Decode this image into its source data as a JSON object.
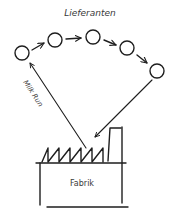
{
  "diagram": {
    "title": "Lieferanten",
    "route_label": "Milk Run",
    "factory_label": "Fabrik",
    "stroke_color": "#1e1e1e",
    "text_color": "#3a3a3a",
    "suppliers": [
      {
        "id": "supplier-1",
        "cx": 22,
        "cy": 53
      },
      {
        "id": "supplier-2",
        "cx": 55,
        "cy": 40
      },
      {
        "id": "supplier-3",
        "cx": 93,
        "cy": 37
      },
      {
        "id": "supplier-4",
        "cx": 127,
        "cy": 48
      },
      {
        "id": "supplier-5",
        "cx": 157,
        "cy": 71
      }
    ],
    "flow": [
      "supplier-1 -> supplier-2",
      "supplier-2 -> supplier-3",
      "supplier-3 -> supplier-4",
      "supplier-4 -> supplier-5",
      "supplier-5 -> Fabrik",
      "Fabrik -> supplier-1"
    ]
  }
}
